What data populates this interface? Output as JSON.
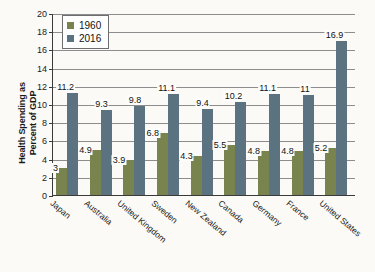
{
  "chart_data": {
    "type": "bar",
    "title": "",
    "xlabel": "",
    "ylabel": "Health Spending as Percent of GDP",
    "ylabel_lines": [
      "Health Spending as",
      "Percent of GDP"
    ],
    "ylim": [
      0,
      20
    ],
    "ytick_step": 2,
    "yticks": [
      0,
      2,
      4,
      6,
      8,
      10,
      12,
      14,
      16,
      18,
      20
    ],
    "ytick_labels": [
      "0",
      "2",
      "4",
      "6",
      "8",
      "10",
      "12",
      "14",
      "16",
      "18",
      "20"
    ],
    "grid": true,
    "grid_axis": "y",
    "legend_position": "upper left",
    "categories": [
      "Japan",
      "Australia",
      "United Kingdom",
      "Sweden",
      "New Zealand",
      "Canada",
      "Germany",
      "France",
      "United States"
    ],
    "series": [
      {
        "name": "1960",
        "color": "#78834e",
        "values": [
          3,
          4.9,
          3.9,
          6.8,
          4.3,
          5.5,
          4.8,
          4.8,
          5.2
        ],
        "labels": [
          "3",
          "4.9",
          "3.9",
          "6.8",
          "4.3",
          "5.5",
          "4.8",
          "4.8",
          "5.2"
        ]
      },
      {
        "name": "2016",
        "color": "#5b7280",
        "values": [
          11.2,
          9.3,
          9.8,
          11.1,
          9.4,
          10.2,
          11.1,
          11,
          16.9
        ],
        "labels": [
          "11.2",
          "9.3",
          "9.8",
          "11.1",
          "9.4",
          "10.2",
          "11.1",
          "11",
          "16.9"
        ]
      }
    ]
  },
  "legend": {
    "entries": [
      {
        "label": "1960",
        "color": "#78834e"
      },
      {
        "label": "2016",
        "color": "#5b7280"
      }
    ]
  },
  "colors": {
    "series_1960": "#78834e",
    "series_2016": "#5b7280",
    "axis": "#3a3a3a",
    "grid": "#8d8d8d",
    "background": "#fbfaf7",
    "text": "#1a1a1a"
  }
}
